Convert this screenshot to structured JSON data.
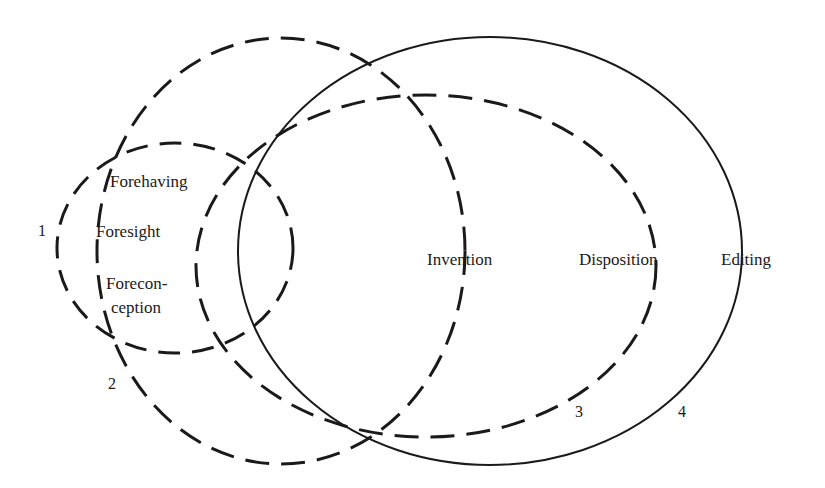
{
  "diagram": {
    "ellipses": [
      {
        "id": "1",
        "cx": 175,
        "cy": 248,
        "rx": 118,
        "ry": 105,
        "style": "dashed"
      },
      {
        "id": "2",
        "cx": 281,
        "cy": 251,
        "rx": 184,
        "ry": 213,
        "style": "dashed"
      },
      {
        "id": "3",
        "cx": 426,
        "cy": 266,
        "rx": 230,
        "ry": 171,
        "style": "dashed"
      },
      {
        "id": "4",
        "cx": 490,
        "cy": 251,
        "rx": 252,
        "ry": 214,
        "style": "solid"
      }
    ],
    "labels": {
      "forehaving": "Forehaving",
      "foresight": "Foresight",
      "foreconception_1": "Forecon-",
      "foreconception_2": "ception",
      "invention": "Invention",
      "disposition": "Disposition",
      "editing": "Editing"
    },
    "numbers": {
      "n1": "1",
      "n2": "2",
      "n3": "3",
      "n4": "4"
    },
    "stroke_color": "#1a1a1a"
  }
}
